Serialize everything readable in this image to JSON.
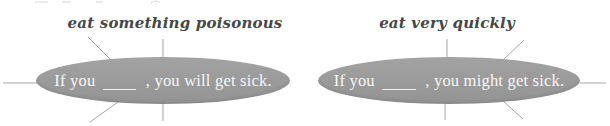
{
  "colors": {
    "ellipse_fill": "#9b9b9b",
    "connector_line": "#a6a6a6",
    "label_text": "#474747",
    "sentence_text": "#f7f7f7"
  },
  "nodes": {
    "left": {
      "label": "eat something poisonous",
      "sentence": {
        "prefix": "If you",
        "blank": "____",
        "suffix": ", you will get sick."
      }
    },
    "right": {
      "label": "eat very quickly",
      "sentence": {
        "prefix": "If you",
        "blank": "____",
        "suffix": ", you might get sick."
      }
    }
  }
}
